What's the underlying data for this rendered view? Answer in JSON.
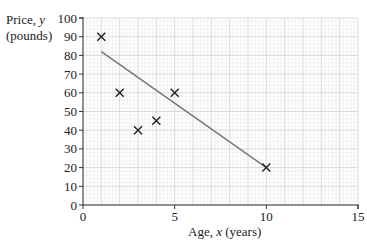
{
  "chart_data": {
    "type": "scatter",
    "title": "",
    "xlabel": "Age, x (years)",
    "ylabel": "Price, y (pounds)",
    "ylabel_lines": [
      "Price, y",
      "(pounds)"
    ],
    "xlim": [
      0,
      15
    ],
    "ylim": [
      0,
      100
    ],
    "x_ticks": [
      0,
      5,
      10,
      15
    ],
    "y_ticks": [
      0,
      10,
      20,
      30,
      40,
      50,
      60,
      70,
      80,
      90,
      100
    ],
    "grid": true,
    "grid_minor_x": 1,
    "grid_minor_y": 2,
    "marker": "x",
    "series": [
      {
        "name": "data points",
        "points": [
          {
            "x": 1,
            "y": 90
          },
          {
            "x": 2,
            "y": 60
          },
          {
            "x": 3,
            "y": 40
          },
          {
            "x": 4,
            "y": 45
          },
          {
            "x": 5,
            "y": 60
          },
          {
            "x": 10,
            "y": 20
          }
        ]
      }
    ],
    "line_of_best_fit": {
      "x1": 1,
      "y1": 82,
      "x2": 10,
      "y2": 20,
      "color": "#777777"
    },
    "colors": {
      "grid_minor": "#e6e6e6",
      "grid_major": "#cfcfcf",
      "axis": "#333333",
      "marker": "#222222"
    }
  },
  "labels": {
    "y_line1": "Price, ",
    "y_var": "y",
    "y_line2": "(pounds)",
    "x_prefix": "Age, ",
    "x_var": "x",
    "x_suffix": " (years)"
  }
}
